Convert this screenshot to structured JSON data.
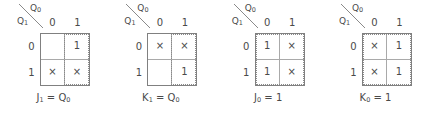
{
  "diagram": {
    "type": "karnaugh-maps",
    "axis_labels": {
      "top": "Q",
      "top_sub": "0",
      "left": "Q",
      "left_sub": "1"
    },
    "column_headers": [
      "0",
      "1"
    ],
    "row_headers": [
      "0",
      "1"
    ],
    "dont_care_symbol": "×",
    "colors": {
      "grid_outer": "#808080",
      "grid_inner": "#a9a9a9",
      "group_outline": "#8a8a8a",
      "text": "#4a4a4a",
      "background": "#ffffff"
    },
    "maps": [
      {
        "name": "j1",
        "caption": "J",
        "caption_sub": "1",
        "caption_eq": " = Q",
        "caption_eq_sub": "0",
        "cells": [
          "",
          "1",
          "×",
          "×"
        ],
        "group": "right-col",
        "group_label": "right-column"
      },
      {
        "name": "k1",
        "caption": "K",
        "caption_sub": "1",
        "caption_eq": " = Q",
        "caption_eq_sub": "0",
        "cells": [
          "×",
          "×",
          "",
          "1"
        ],
        "group": "right-col",
        "group_label": "right-column"
      },
      {
        "name": "j0",
        "caption": "J",
        "caption_sub": "0",
        "caption_eq": " = 1",
        "caption_eq_sub": "",
        "cells": [
          "1",
          "×",
          "1",
          "×"
        ],
        "group": "full",
        "group_label": "all-cells"
      },
      {
        "name": "k0",
        "caption": "K",
        "caption_sub": "0",
        "caption_eq": " = 1",
        "caption_eq_sub": "",
        "cells": [
          "×",
          "1",
          "×",
          "1"
        ],
        "group": "full",
        "group_label": "all-cells"
      }
    ]
  }
}
